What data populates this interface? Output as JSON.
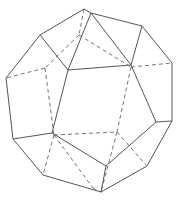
{
  "figure": {
    "solid_edges": [
      [
        84,
        9,
        91,
        13
      ],
      [
        84,
        9,
        40,
        35
      ],
      [
        91,
        13,
        142,
        26
      ],
      [
        91,
        13,
        68,
        70
      ],
      [
        91,
        13,
        131,
        65
      ],
      [
        40,
        35,
        6,
        78
      ],
      [
        40,
        35,
        68,
        70
      ],
      [
        142,
        26,
        172,
        63
      ],
      [
        142,
        26,
        131,
        65
      ],
      [
        68,
        70,
        131,
        65
      ],
      [
        6,
        78,
        13,
        139
      ],
      [
        172,
        63,
        172,
        121
      ],
      [
        68,
        70,
        52,
        133
      ],
      [
        131,
        65,
        156,
        122
      ],
      [
        13,
        139,
        52,
        133
      ],
      [
        13,
        139,
        43,
        175
      ],
      [
        52,
        133,
        106,
        166
      ],
      [
        156,
        122,
        172,
        121
      ],
      [
        156,
        122,
        106,
        166
      ],
      [
        172,
        121,
        147,
        166
      ],
      [
        43,
        175,
        101,
        192
      ],
      [
        106,
        166,
        101,
        192
      ],
      [
        147,
        166,
        101,
        192
      ]
    ],
    "dashed_edges": [
      [
        84,
        9,
        79,
        35
      ],
      [
        79,
        35,
        45,
        68
      ],
      [
        79,
        35,
        131,
        67
      ],
      [
        45,
        68,
        6,
        78
      ],
      [
        45,
        68,
        54,
        135
      ],
      [
        131,
        67,
        172,
        63
      ],
      [
        131,
        67,
        117,
        132
      ],
      [
        54,
        135,
        117,
        132
      ],
      [
        54,
        135,
        43,
        175
      ],
      [
        54,
        135,
        93,
        188
      ],
      [
        117,
        132,
        146,
        165
      ],
      [
        117,
        132,
        101,
        192
      ],
      [
        93,
        188,
        101,
        192
      ]
    ]
  }
}
